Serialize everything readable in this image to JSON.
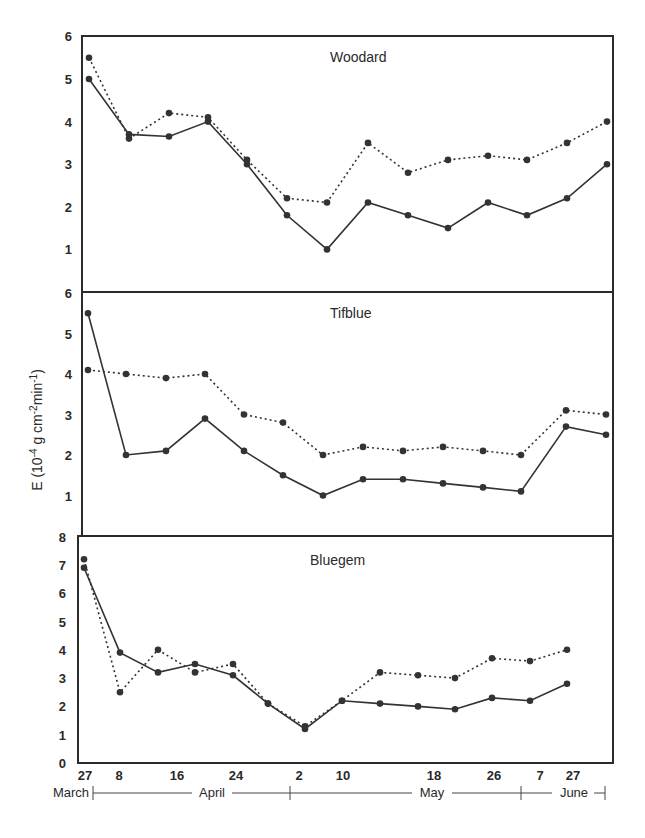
{
  "chart_data": {
    "type": "line",
    "layout": "three vertically stacked panels sharing one x-axis",
    "ylabel": "E (10-4 g cm-2min-1)",
    "ylabel_parts": {
      "prefix": "E (10",
      "sup1": "-4",
      "mid": " g cm",
      "sup2": "-2",
      "mid2": "min",
      "sup3": "-1",
      "suffix": ")"
    },
    "x_tick_labels": [
      "27",
      "8",
      "16",
      "24",
      "2",
      "10",
      "18",
      "26",
      "7",
      "27"
    ],
    "x_month_labels": [
      "March",
      "April",
      "May",
      "June"
    ],
    "grid": false,
    "legend": null,
    "series_styles": [
      "solid",
      "dotted"
    ],
    "panels": [
      {
        "title": "Woodard",
        "ylim": [
          0,
          6
        ],
        "y_ticks": [
          1,
          2,
          3,
          4,
          5,
          6
        ],
        "series": [
          {
            "name": "solid",
            "style": "solid",
            "values": [
              5.0,
              3.7,
              3.65,
              4.0,
              3.0,
              1.8,
              1.0,
              2.1,
              1.8,
              1.5,
              2.1,
              1.8,
              2.2,
              3.0
            ]
          },
          {
            "name": "dotted",
            "style": "dotted",
            "values": [
              5.5,
              3.6,
              4.2,
              4.1,
              3.1,
              2.2,
              2.1,
              3.5,
              2.8,
              3.1,
              3.2,
              3.1,
              3.5,
              4.0
            ]
          }
        ]
      },
      {
        "title": "Tifblue",
        "ylim": [
          0,
          6
        ],
        "y_ticks": [
          1,
          2,
          3,
          4,
          5,
          6
        ],
        "series": [
          {
            "name": "solid",
            "style": "solid",
            "values": [
              5.5,
              2.0,
              2.1,
              2.9,
              2.1,
              1.5,
              1.0,
              1.4,
              1.4,
              1.3,
              1.2,
              1.1,
              2.7,
              2.5
            ]
          },
          {
            "name": "dotted",
            "style": "dotted",
            "values": [
              4.1,
              4.0,
              3.9,
              4.0,
              3.0,
              2.8,
              2.0,
              2.2,
              2.1,
              2.2,
              2.1,
              2.0,
              3.1,
              3.0
            ]
          }
        ]
      },
      {
        "title": "Bluegem",
        "ylim": [
          0,
          8
        ],
        "y_ticks": [
          0,
          1,
          2,
          3,
          4,
          5,
          6,
          7,
          8
        ],
        "series": [
          {
            "name": "solid",
            "style": "solid",
            "values": [
              6.9,
              3.9,
              3.2,
              3.5,
              3.1,
              2.1,
              1.2,
              2.2,
              2.1,
              2.0,
              1.9,
              2.3,
              2.2,
              2.8
            ]
          },
          {
            "name": "dotted",
            "style": "dotted",
            "values": [
              7.2,
              2.5,
              4.0,
              3.2,
              3.5,
              2.1,
              1.3,
              2.2,
              3.2,
              3.1,
              3.0,
              3.7,
              3.6,
              4.0
            ]
          }
        ]
      }
    ]
  },
  "colors": {
    "ink": "#333333",
    "frame": "#2b2b2b",
    "background": "#ffffff"
  }
}
